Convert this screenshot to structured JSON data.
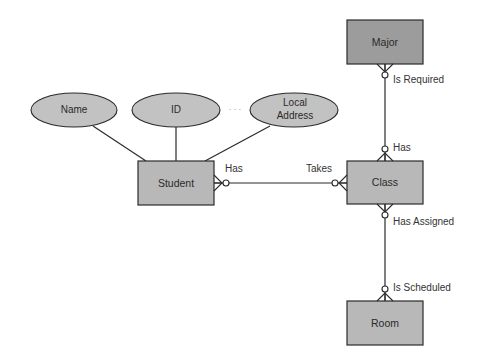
{
  "diagram": {
    "type": "entity-relationship",
    "colors": {
      "entity_fill": "#b8b8b8",
      "entity_fill_dark": "#9c9c9c",
      "attribute_fill": "#c2c2c2",
      "stroke": "#2b2b2b",
      "text": "#2a2a2a"
    },
    "entities": [
      {
        "id": "major",
        "label": "Major",
        "shade": "dark"
      },
      {
        "id": "student",
        "label": "Student",
        "shade": "normal"
      },
      {
        "id": "class",
        "label": "Class",
        "shade": "normal"
      },
      {
        "id": "room",
        "label": "Room",
        "shade": "normal"
      }
    ],
    "attributes": [
      {
        "id": "name",
        "label": "Name",
        "entity": "student"
      },
      {
        "id": "id",
        "label": "ID",
        "entity": "student"
      },
      {
        "id": "local-address",
        "label_line1": "Local",
        "label_line2": "Address",
        "entity": "student"
      }
    ],
    "ellipsis": "· · ·",
    "relationships": [
      {
        "from": "student",
        "to": "class",
        "from_label": "Has",
        "to_label": "Takes",
        "from_cardinality": "zero-or-many",
        "to_cardinality": "zero-or-many"
      },
      {
        "from": "major",
        "to": "class",
        "from_label": "Is Required",
        "to_label": "Has",
        "from_cardinality": "zero-or-many",
        "to_cardinality": "zero-or-many"
      },
      {
        "from": "class",
        "to": "room",
        "from_label": "Has Assigned",
        "to_label": "Is Scheduled",
        "from_cardinality": "zero-or-many",
        "to_cardinality": "zero-or-many"
      }
    ]
  }
}
